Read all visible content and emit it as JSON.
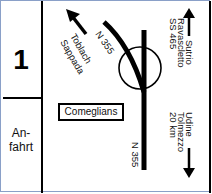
{
  "panel": {
    "number": "1",
    "label_line1": "An-",
    "label_line2": "fahrt"
  },
  "map": {
    "town": "Comeglians",
    "road_upper": "N 355",
    "road_lower": "N 355",
    "destinations": {
      "upper_left": {
        "line1": "Toblach",
        "line2": "Sappada",
        "arrow": "arrow-up-left"
      },
      "upper_right": {
        "line1": "Sutrio",
        "line2": "Ravascletto",
        "line3": "SS 465",
        "arrow": "arrow-up"
      },
      "lower_right": {
        "line1": "Udine",
        "line2": "Tolmezzo",
        "line3": "20 km",
        "arrow": "arrow-down"
      }
    }
  }
}
